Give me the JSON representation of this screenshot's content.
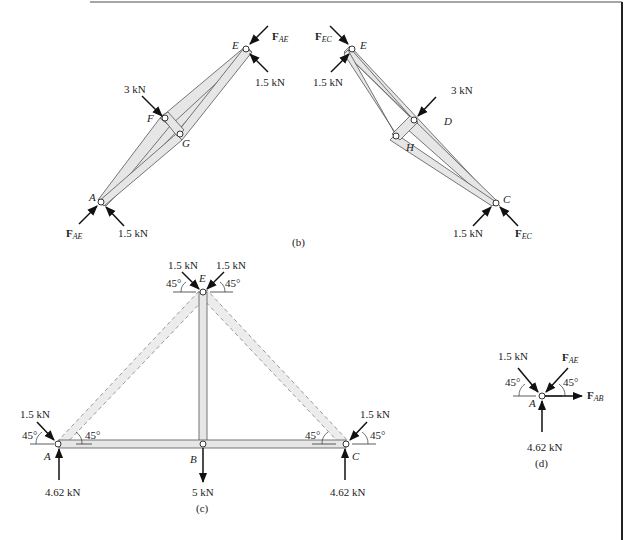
{
  "figure": {
    "panels": {
      "b": {
        "caption": "(b)",
        "left_member": {
          "joints": {
            "top": "E",
            "mid1": "F",
            "mid2": "G",
            "bottom": "A"
          },
          "loads": {
            "top_force_main": "F",
            "top_force_sub": "AE",
            "top_load": "1.5 kN",
            "mid_load": "3 kN",
            "bottom_force_main": "F",
            "bottom_force_sub": "AE",
            "bottom_load": "1.5 kN"
          }
        },
        "right_member": {
          "joints": {
            "top": "E",
            "mid1": "D",
            "mid2": "H",
            "bottom": "C"
          },
          "loads": {
            "top_force_main": "F",
            "top_force_sub": "EC",
            "top_load": "1.5 kN",
            "mid_load": "3 kN",
            "bottom_force_main": "F",
            "bottom_force_sub": "EC",
            "bottom_load": "1.5 kN"
          }
        }
      },
      "c": {
        "caption": "(c)",
        "joints": {
          "top": "E",
          "left": "A",
          "middle": "B",
          "right": "C"
        },
        "loads": {
          "top_left": "1.5 kN",
          "top_right": "1.5 kN",
          "left_applied": "1.5 kN",
          "right_applied": "1.5 kN",
          "left_reaction": "4.62 kN",
          "right_reaction": "4.62 kN",
          "middle_load": "5 kN"
        },
        "angles": {
          "top_left": "45°",
          "top_right": "45°",
          "a_outer": "45°",
          "a_inner": "45°",
          "c_inner": "45°",
          "c_outer": "45°"
        }
      },
      "d": {
        "caption": "(d)",
        "joint": "A",
        "loads": {
          "applied": "1.5 kN",
          "force_ae_main": "F",
          "force_ae_sub": "AE",
          "force_ab_main": "F",
          "force_ab_sub": "AB",
          "reaction": "4.62 kN"
        },
        "angles": {
          "left": "45°",
          "right": "45°"
        }
      }
    },
    "colors": {
      "member_fill": "#e6e6e6",
      "member_stroke": "#555555",
      "dashed_stroke": "#9a9a9a",
      "arrow": "#111111",
      "frame": "#222222"
    }
  }
}
